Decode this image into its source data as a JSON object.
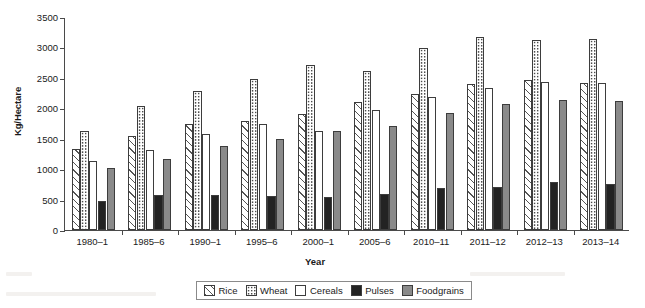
{
  "chart_data": {
    "type": "bar",
    "title": "",
    "subtitle": "",
    "xlabel": "Year",
    "ylabel": "Kg/Hectare",
    "ylim": [
      0,
      3500
    ],
    "yticks": [
      0,
      500,
      1000,
      1500,
      2000,
      2500,
      3000,
      3500
    ],
    "grid": false,
    "legend_position": "bottom",
    "categories": [
      "1980–1",
      "1985–6",
      "1990–1",
      "1995–6",
      "2000–1",
      "2005–6",
      "2010–11",
      "2011–12",
      "2012–13",
      "2013–14"
    ],
    "series": [
      {
        "name": "Rice",
        "swatch": "diagonal-hatch",
        "color": "#ffffff",
        "values": [
          1336,
          1552,
          1740,
          1797,
          1901,
          2102,
          2239,
          2393,
          2461,
          2416
        ]
      },
      {
        "name": "Wheat",
        "swatch": "dotted",
        "color": "#ffffff",
        "values": [
          1630,
          2046,
          2281,
          2483,
          2708,
          2619,
          2988,
          3177,
          3117,
          3145
        ]
      },
      {
        "name": "Cereals",
        "swatch": "solid-white",
        "color": "#ffffff",
        "values": [
          1142,
          1318,
          1571,
          1744,
          1626,
          1968,
          2184,
          2337,
          2439,
          2419
        ]
      },
      {
        "name": "Pulses",
        "swatch": "solid-black",
        "color": "#232323",
        "values": [
          473,
          578,
          578,
          552,
          544,
          598,
          691,
          699,
          789,
          764
        ]
      },
      {
        "name": "Foodgrains",
        "swatch": "solid-gray",
        "color": "#8a8a8a",
        "values": [
          1023,
          1175,
          1380,
          1491,
          1626,
          1715,
          1930,
          2078,
          2129,
          2120
        ]
      }
    ]
  },
  "axis": {
    "y_title": "Kg/Hectare",
    "x_title": "Year",
    "y_tick_labels": [
      "3500",
      "3000",
      "2500",
      "2000",
      "1500",
      "1000",
      "500",
      "0"
    ],
    "x_tick_labels": [
      "1980–1",
      "1985–6",
      "1990–1",
      "1995–6",
      "2000–1",
      "2005–6",
      "2010–11",
      "2011–12",
      "2012–13",
      "2013–14"
    ]
  },
  "legend": {
    "items": [
      {
        "label": "Rice",
        "swatch": "diagonal-hatch"
      },
      {
        "label": "Wheat",
        "swatch": "dotted"
      },
      {
        "label": "Cereals",
        "swatch": "solid-white"
      },
      {
        "label": "Pulses",
        "swatch": "solid-black"
      },
      {
        "label": "Foodgrains",
        "swatch": "solid-gray"
      }
    ]
  },
  "colors": {
    "axis": "#4a4a4a",
    "bar_outline": "#3d3d3d",
    "pulses": "#232323",
    "foodgrains": "#8a8a8a",
    "text": "#1a1a1a"
  }
}
